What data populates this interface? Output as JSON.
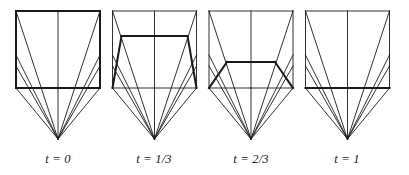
{
  "figure": {
    "type": "geometric-diagram",
    "background_color": "#ffffff",
    "line_color": "#1a1a1a",
    "thin_stroke_width": 0.9,
    "bold_stroke_width": 2.0
  },
  "geometry": {
    "box": {
      "left": 16,
      "right": 100,
      "top": 11,
      "bottom": 88,
      "mid_x": 58
    },
    "apex": {
      "x": 58,
      "y": 139
    },
    "left_edge_fan_nodes_y": [
      11,
      55,
      66
    ],
    "right_edge_fan_nodes_y": [
      11,
      55,
      66
    ],
    "trapezoid_inset_at_t1": 0,
    "panel_pitch": 96.5
  },
  "panels": [
    {
      "id": "panel-t0",
      "label": "t = 0",
      "t_value": 0,
      "x_offset": 0,
      "top_y": 11,
      "half_width_top": 42,
      "bold_shape": "full-rectangle"
    },
    {
      "id": "panel-t13",
      "label": "t = 1/3",
      "t_value": 0.3333,
      "x_offset": 96.5,
      "top_y": 36,
      "half_width_top": 33,
      "bold_shape": "trapezoid"
    },
    {
      "id": "panel-t23",
      "label": "t = 2/3",
      "t_value": 0.6667,
      "x_offset": 193,
      "top_y": 62,
      "half_width_top": 24,
      "bold_shape": "trapezoid"
    },
    {
      "id": "panel-t1",
      "label": "t = 1",
      "t_value": 1,
      "x_offset": 289.5,
      "top_y": 88,
      "half_width_top": 42,
      "bold_shape": "collapsed-segment"
    }
  ],
  "labels": {
    "t0": "t = 0",
    "t13": "t = 1/3",
    "t23": "t = 2/3",
    "t1": "t = 1"
  }
}
